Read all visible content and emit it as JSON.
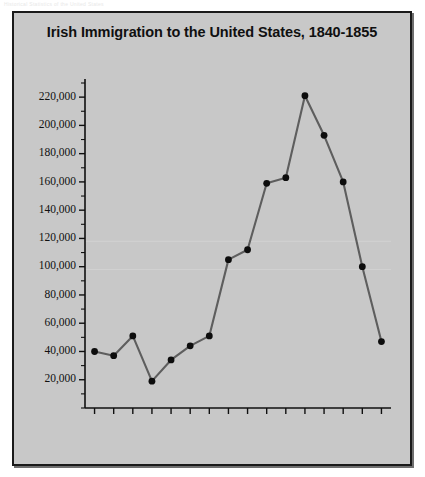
{
  "faint_header": "Historical Statistics of the United States",
  "figure": {
    "title": "Irish Immigration to the United States, 1840-1855",
    "background_color": "#c8c8c8",
    "border_color": "#1a1a1a"
  },
  "chart_data": {
    "type": "line",
    "title": "Irish Immigration to the United States, 1840-1855",
    "xlabel": "",
    "ylabel": "",
    "categories": [
      "1840",
      "1841",
      "1842",
      "1843",
      "1844",
      "1845",
      "1846",
      "1847",
      "1848",
      "1849",
      "1850",
      "1851",
      "1852",
      "1853",
      "1854",
      "1855"
    ],
    "values": [
      40000,
      37000,
      51000,
      19000,
      34000,
      44000,
      51000,
      105000,
      112000,
      159000,
      163000,
      221000,
      193000,
      160000,
      100000,
      47000
    ],
    "ylim": [
      0,
      230000
    ],
    "y_major_ticks": [
      20000,
      40000,
      60000,
      80000,
      100000,
      120000,
      140000,
      160000,
      180000,
      200000,
      220000
    ],
    "y_tick_labels": [
      "20,000",
      "40,000",
      "60,000",
      "80,000",
      "100,000",
      "120,000",
      "140,000",
      "160,000",
      "180,000",
      "200,000",
      "220,000"
    ],
    "y_minor_tick_step": 10000,
    "grid": false,
    "legend": null,
    "line_color": "#5e5e5e",
    "marker_color": "#0d0d0d",
    "axis_color": "#101010"
  }
}
